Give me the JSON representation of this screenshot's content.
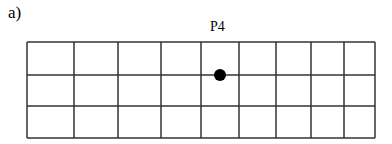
{
  "panel_label": "a)",
  "point_label": "P4",
  "grid": {
    "rows": 3,
    "columns": 9,
    "x_lines": [
      27,
      74,
      118,
      161,
      201,
      239,
      276,
      311,
      344,
      375
    ],
    "y_lines": [
      42,
      75,
      106,
      138
    ],
    "line_color": "#333333"
  },
  "point": {
    "name": "P4",
    "cx": 220,
    "cy": 75,
    "r": 6,
    "color": "#000000"
  }
}
